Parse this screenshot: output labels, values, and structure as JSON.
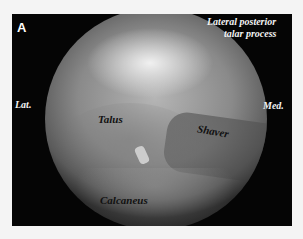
{
  "figure": {
    "panel_label": "A",
    "annotations": {
      "lateral_posterior_talar_process": [
        "Lateral posterior",
        "talar process"
      ],
      "lateral": "Lat.",
      "medial": "Med.",
      "talus": "Talus",
      "shaver": "Shaver",
      "calcaneus": "Calcaneus"
    },
    "colors": {
      "frame": "#050505",
      "background": "#f4f4f4",
      "light_label": "#f4f4f4",
      "dark_label": "#111111"
    }
  }
}
